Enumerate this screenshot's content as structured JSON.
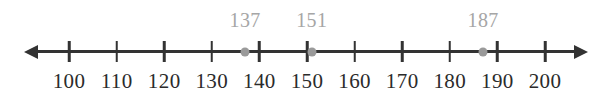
{
  "figure": {
    "type": "number-line",
    "width": 610,
    "height": 101,
    "background": "#ffffff"
  },
  "chart_data": {
    "type": "number-line",
    "title": "",
    "subtitle": "",
    "xlabel": "",
    "ylabel": "",
    "orientation": "horizontal",
    "axis": {
      "min_tick": 100,
      "max_tick": 200,
      "tick_step": 10,
      "arrow_left": true,
      "arrow_right": true,
      "line_color": "#333333",
      "tick_color": "#333333",
      "label_color": "#2b2b2b"
    },
    "ticks": [
      {
        "value": 100,
        "label": "100",
        "x": 69
      },
      {
        "value": 110,
        "label": "110",
        "x": 116.6
      },
      {
        "value": 120,
        "label": "120",
        "x": 164.2
      },
      {
        "value": 130,
        "label": "130",
        "x": 211.8
      },
      {
        "value": 140,
        "label": "140",
        "x": 259.4
      },
      {
        "value": 150,
        "label": "150",
        "x": 307
      },
      {
        "value": 160,
        "label": "160",
        "x": 354.6
      },
      {
        "value": 170,
        "label": "170",
        "x": 402.2
      },
      {
        "value": 180,
        "label": "180",
        "x": 449.8
      },
      {
        "value": 190,
        "label": "190",
        "x": 497.4
      },
      {
        "value": 200,
        "label": "200",
        "x": 545
      }
    ],
    "points": [
      {
        "value": 137,
        "label": "137",
        "x": 245.1,
        "dot_color": "#9a9a9a",
        "label_color": "#a6a6a6"
      },
      {
        "value": 151,
        "label": "151",
        "x": 311.8,
        "dot_color": "#9a9a9a",
        "label_color": "#a6a6a6"
      },
      {
        "value": 187,
        "label": "187",
        "x": 483.1,
        "dot_color": "#9a9a9a",
        "label_color": "#a6a6a6"
      }
    ],
    "legend": [],
    "annotations": [],
    "grid": false
  }
}
